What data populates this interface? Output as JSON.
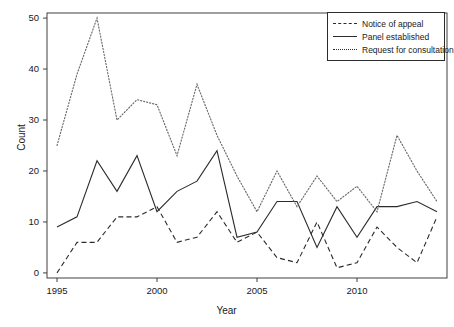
{
  "chart_data": {
    "type": "line",
    "title": "",
    "xlabel": "Year",
    "ylabel": "Count",
    "x": [
      1995,
      1996,
      1997,
      1998,
      1999,
      2000,
      2001,
      2002,
      2003,
      2004,
      2005,
      2006,
      2007,
      2008,
      2009,
      2010,
      2011,
      2012,
      2013,
      2014
    ],
    "xlim": [
      1994.5,
      2014.5
    ],
    "ylim": [
      -1,
      51
    ],
    "xticks": [
      1995,
      2000,
      2005,
      2010
    ],
    "xticklabels": [
      "1995",
      "2000",
      "2005",
      "2010"
    ],
    "yticks": [
      0,
      10,
      20,
      30,
      40,
      50
    ],
    "yticklabels": [
      "0",
      "10",
      "20",
      "30",
      "40",
      "50"
    ],
    "grid": false,
    "legend_position": "top-right",
    "series": [
      {
        "name": "Notice of appeal",
        "style": "dashed",
        "color": "#2b2b2b",
        "values": [
          0,
          6,
          6,
          11,
          11,
          13,
          6,
          7,
          12,
          6,
          8,
          3,
          2,
          10,
          1,
          2,
          9,
          5,
          2,
          11
        ]
      },
      {
        "name": "Panel established",
        "style": "solid",
        "color": "#2b2b2b",
        "values": [
          9,
          11,
          22,
          16,
          23,
          12,
          16,
          18,
          24,
          7,
          8,
          14,
          14,
          5,
          13,
          7,
          13,
          13,
          14,
          12
        ]
      },
      {
        "name": "Request for consultation",
        "style": "dotted",
        "color": "#6b6b6b",
        "values": [
          25,
          39,
          50,
          30,
          34,
          33,
          23,
          37,
          27,
          19,
          12,
          20,
          13,
          19,
          14,
          17,
          12,
          27,
          20,
          14
        ]
      }
    ]
  },
  "axes": {
    "ylabel": "Count",
    "xlabel": "Year"
  },
  "legend": {
    "items": [
      {
        "label": "Notice of appeal",
        "key": "dashed-line-key"
      },
      {
        "label": "Panel established",
        "key": "solid-line-key"
      },
      {
        "label": "Request for consultation",
        "key": "dotted-line-key"
      }
    ]
  }
}
